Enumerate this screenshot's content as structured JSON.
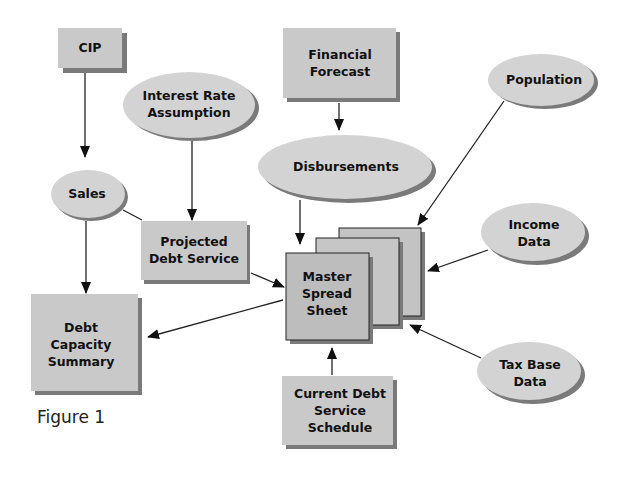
{
  "figure_caption": "Figure 1",
  "colors": {
    "box_fill": "#c9c9c9",
    "ellipse_fill": "#d3d3d3",
    "master_fill": "#bdbdbd",
    "shadow": "#7a7a7a",
    "stroke": "#222222",
    "background": "#ffffff"
  },
  "nodes": {
    "cip": {
      "shape": "rectangle",
      "lines": [
        "CIP"
      ]
    },
    "interest_rate": {
      "shape": "ellipse",
      "lines": [
        "Interest Rate",
        "Assumption"
      ]
    },
    "financial_forecast": {
      "shape": "rectangle",
      "lines": [
        "Financial",
        "Forecast"
      ]
    },
    "population": {
      "shape": "ellipse",
      "lines": [
        "Population"
      ]
    },
    "disbursements": {
      "shape": "ellipse",
      "lines": [
        "Disbursements"
      ]
    },
    "sales": {
      "shape": "ellipse",
      "lines": [
        "Sales"
      ]
    },
    "projected_debt": {
      "shape": "rectangle",
      "lines": [
        "Projected",
        "Debt Service"
      ]
    },
    "master": {
      "shape": "stacked-rectangles",
      "lines": [
        "Master",
        "Spread",
        "Sheet"
      ]
    },
    "income": {
      "shape": "ellipse",
      "lines": [
        "Income",
        "Data"
      ]
    },
    "debt_capacity": {
      "shape": "rectangle",
      "lines": [
        "Debt",
        "Capacity",
        "Summary"
      ]
    },
    "tax_base": {
      "shape": "ellipse",
      "lines": [
        "Tax Base",
        "Data"
      ]
    },
    "current_debt": {
      "shape": "rectangle",
      "lines": [
        "Current Debt",
        "Service",
        "Schedule"
      ]
    }
  },
  "edges": [
    {
      "from": "CIP",
      "to": "Sales",
      "arrow": true
    },
    {
      "from": "Interest Rate Assumption",
      "to": "Projected Debt Service",
      "arrow": true
    },
    {
      "from": "Financial Forecast",
      "to": "Disbursements",
      "arrow": true
    },
    {
      "from": "Sales",
      "to": "Projected Debt Service",
      "arrow": false
    },
    {
      "from": "Sales",
      "to": "Debt Capacity Summary",
      "arrow": true
    },
    {
      "from": "Disbursements",
      "to": "Master Spread Sheet",
      "arrow": true
    },
    {
      "from": "Population",
      "to": "Master Spread Sheet",
      "arrow": true
    },
    {
      "from": "Projected Debt Service",
      "to": "Master Spread Sheet",
      "arrow": true
    },
    {
      "from": "Income Data",
      "to": "Master Spread Sheet",
      "arrow": true
    },
    {
      "from": "Master Spread Sheet",
      "to": "Debt Capacity Summary",
      "arrow": true
    },
    {
      "from": "Tax Base Data",
      "to": "Master Spread Sheet",
      "arrow": true
    },
    {
      "from": "Current Debt Service Schedule",
      "to": "Master Spread Sheet",
      "arrow": true
    }
  ]
}
